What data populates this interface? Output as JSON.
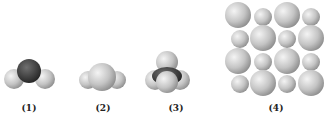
{
  "figure": {
    "labels": [
      "(1)",
      "(2)",
      "(3)",
      "(4)"
    ],
    "models": [
      {
        "id": 1,
        "type": "bent-molecule-space-filling",
        "central_color": "#444444",
        "outer_color": "#c8c8c8"
      },
      {
        "id": 2,
        "type": "trigonal-molecule-space-filling",
        "central_color": "#bdbdbd",
        "outer_color": "#c8c8c8"
      },
      {
        "id": 3,
        "type": "tetrahedral-molecule-space-filling",
        "central_color": "#2e2e2e",
        "outer_color": "#cdcdcd"
      },
      {
        "id": 4,
        "type": "ionic-lattice-4x4",
        "large_color": "#c4c4c4",
        "small_color": "#b8b8b8",
        "pattern": [
          [
            "L",
            "S",
            "L",
            "S"
          ],
          [
            "S",
            "L",
            "S",
            "L"
          ],
          [
            "L",
            "S",
            "L",
            "S"
          ],
          [
            "S",
            "L",
            "S",
            "L"
          ]
        ]
      }
    ]
  }
}
